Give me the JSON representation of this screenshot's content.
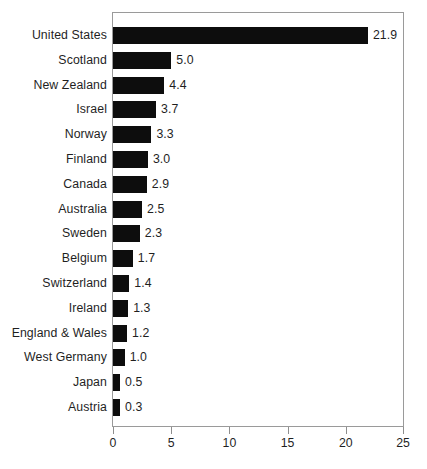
{
  "chart_data": {
    "type": "bar",
    "orientation": "horizontal",
    "title": "",
    "xlabel": "",
    "ylabel": "",
    "xlim": [
      0,
      25
    ],
    "xticks": [
      "0",
      "5",
      "10",
      "15",
      "20",
      "25"
    ],
    "grid": false,
    "legend": false,
    "bar_color": "#0d0d0d",
    "frame_color": "#9a9a9a",
    "categories": [
      "United States",
      "Scotland",
      "New Zealand",
      "Israel",
      "Norway",
      "Finland",
      "Canada",
      "Australia",
      "Sweden",
      "Belgium",
      "Switzerland",
      "Ireland",
      "England & Wales",
      "West Germany",
      "Japan",
      "Austria"
    ],
    "values": [
      21.9,
      5.0,
      4.4,
      3.7,
      3.3,
      3.0,
      2.9,
      2.5,
      2.3,
      1.7,
      1.4,
      1.3,
      1.2,
      1.0,
      0.5,
      0.3
    ],
    "value_labels": [
      "21.9",
      "5.0",
      "4.4",
      "3.7",
      "3.3",
      "3.0",
      "2.9",
      "2.5",
      "2.3",
      "1.7",
      "1.4",
      "1.3",
      "1.2",
      "1.0",
      "0.5",
      "0.3"
    ]
  }
}
